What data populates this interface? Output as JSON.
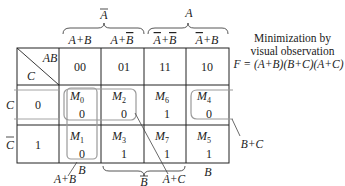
{
  "diagram": {
    "type": "karnaugh-map",
    "variables": [
      "A",
      "B",
      "C"
    ],
    "top_group_labels": [
      {
        "label": "A",
        "overbar": true,
        "spans_columns": [
          0,
          1
        ]
      },
      {
        "label": "A",
        "overbar": false,
        "spans_columns": [
          2,
          3
        ]
      }
    ],
    "column_sum_terms": [
      {
        "parts": [
          {
            "t": "A",
            "bar": false
          },
          {
            "t": "+",
            "bar": false
          },
          {
            "t": "B",
            "bar": false
          }
        ]
      },
      {
        "parts": [
          {
            "t": "A",
            "bar": false
          },
          {
            "t": "+",
            "bar": false
          },
          {
            "t": "B",
            "bar": true
          }
        ]
      },
      {
        "parts": [
          {
            "t": "A",
            "bar": true
          },
          {
            "t": "+",
            "bar": false
          },
          {
            "t": "B",
            "bar": true
          }
        ]
      },
      {
        "parts": [
          {
            "t": "A",
            "bar": true
          },
          {
            "t": "+",
            "bar": false
          },
          {
            "t": "B",
            "bar": false
          }
        ]
      }
    ],
    "corner": {
      "top_right": "AB",
      "bottom_left": "C"
    },
    "column_codes": [
      "00",
      "01",
      "11",
      "10"
    ],
    "rows": [
      {
        "row_label": "C",
        "row_label_bar": false,
        "code": "0",
        "cells": [
          {
            "maxterm": "M",
            "index": "0",
            "value": "0"
          },
          {
            "maxterm": "M",
            "index": "2",
            "value": "0"
          },
          {
            "maxterm": "M",
            "index": "6",
            "value": "1"
          },
          {
            "maxterm": "M",
            "index": "4",
            "value": "0"
          }
        ]
      },
      {
        "row_label": "C",
        "row_label_bar": true,
        "code": "1",
        "cells": [
          {
            "maxterm": "M",
            "index": "1",
            "value": "0"
          },
          {
            "maxterm": "M",
            "index": "3",
            "value": "1"
          },
          {
            "maxterm": "M",
            "index": "7",
            "value": "1"
          },
          {
            "maxterm": "M",
            "index": "5",
            "value": "1"
          }
        ]
      }
    ],
    "bottom_labels": [
      {
        "label": "B",
        "bar": false,
        "under_column": 0
      },
      {
        "label": "B",
        "bar": true,
        "under_columns": [
          1,
          2
        ]
      },
      {
        "label": "B",
        "bar": false,
        "under_column": 3
      }
    ],
    "groups": [
      {
        "term": "A+B",
        "cells": [
          "M0",
          "M1"
        ]
      },
      {
        "term": "A+C",
        "cells": [
          "M0",
          "M2"
        ]
      },
      {
        "term": "B+C",
        "cells": [
          "M0",
          "M4"
        ]
      }
    ],
    "note": {
      "line1": "Minimization by",
      "line2": "visual observation",
      "expression": "F = (A+B)(B+C)(A+C)"
    },
    "colors": {
      "ink": "#222222",
      "loop": "#9a9a9a",
      "grid": "#222222"
    }
  }
}
